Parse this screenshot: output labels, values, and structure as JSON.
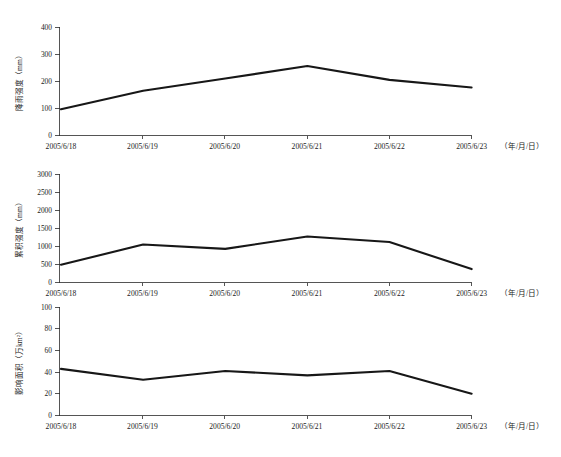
{
  "figure": {
    "name": "rainfall-triple-line-figure",
    "background_color": "#ffffff",
    "line_color": "#171717",
    "axis_color": "#2b2b2b"
  },
  "chart_data": [
    {
      "type": "line",
      "name": "rainfall-intensity",
      "title": "",
      "xlabel": "（年/月/日）",
      "ylabel": "降雨强度（mm）",
      "x": [
        "2005/6/18",
        "2005/6/19",
        "2005/6/20",
        "2005/6/21",
        "2005/6/22",
        "2005/6/23"
      ],
      "categories": [
        "2005/6/18",
        "2005/6/19",
        "2005/6/20",
        "2005/6/21",
        "2005/6/22",
        "2005/6/23"
      ],
      "values": [
        97,
        165,
        210,
        256,
        205,
        177
      ],
      "yticks": [
        0,
        100,
        200,
        300,
        400
      ],
      "ytick_labels": [
        "0",
        "100",
        "200",
        "300",
        "400"
      ],
      "ylim": [
        0,
        400
      ],
      "grid": false,
      "legend": "none"
    },
    {
      "type": "line",
      "name": "cumulative-intensity",
      "title": "",
      "xlabel": "（年/月/日）",
      "ylabel": "累积强度（mm）",
      "x": [
        "2005/6/18",
        "2005/6/19",
        "2005/6/20",
        "2005/6/21",
        "2005/6/22",
        "2005/6/23"
      ],
      "categories": [
        "2005/6/18",
        "2005/6/19",
        "2005/6/20",
        "2005/6/21",
        "2005/6/22",
        "2005/6/23"
      ],
      "values": [
        490,
        1050,
        930,
        1270,
        1120,
        370
      ],
      "yticks": [
        0,
        500,
        1000,
        1500,
        2000,
        2500,
        3000
      ],
      "ytick_labels": [
        "0",
        "500",
        "1000",
        "1500",
        "2000",
        "2500",
        "3000"
      ],
      "ylim": [
        0,
        3000
      ],
      "grid": false,
      "legend": "none"
    },
    {
      "type": "line",
      "name": "affected-area",
      "title": "",
      "xlabel": "（年/月/日）",
      "ylabel": "影响面积（万km²）",
      "x": [
        "2005/6/18",
        "2005/6/19",
        "2005/6/20",
        "2005/6/21",
        "2005/6/22",
        "2005/6/23"
      ],
      "categories": [
        "2005/6/18",
        "2005/6/19",
        "2005/6/20",
        "2005/6/21",
        "2005/6/22",
        "2005/6/23"
      ],
      "values": [
        43,
        33,
        41,
        37,
        41,
        20
      ],
      "yticks": [
        0,
        20,
        40,
        60,
        80,
        100
      ],
      "ytick_labels": [
        "0",
        "20",
        "40",
        "60",
        "80",
        "100"
      ],
      "ylim": [
        0,
        100
      ],
      "grid": false,
      "legend": "none"
    }
  ]
}
